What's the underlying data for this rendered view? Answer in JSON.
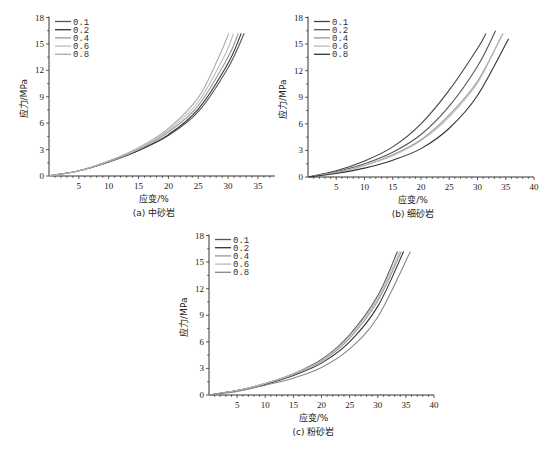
{
  "chart_data": [
    {
      "id": "a",
      "type": "line",
      "caption": "(a) 中砂岩",
      "xlabel": "应变/%",
      "ylabel": "应力/MPa",
      "xlim": [
        0,
        37
      ],
      "ylim": [
        0,
        18
      ],
      "xticks": [
        5,
        10,
        15,
        20,
        25,
        30,
        35
      ],
      "yticks": [
        0,
        3,
        6,
        9,
        12,
        15,
        18
      ],
      "legend_position": "upper-left",
      "grid": false,
      "series": [
        {
          "name": "0.1",
          "color": "#555555",
          "x": [
            0,
            5,
            10,
            15,
            20,
            25,
            30,
            32.7
          ],
          "y": [
            0,
            0.6,
            1.6,
            2.9,
            4.6,
            7.3,
            12.3,
            16.2
          ]
        },
        {
          "name": "0.2",
          "color": "#333333",
          "x": [
            0,
            5,
            10,
            15,
            20,
            25,
            30,
            32.2
          ],
          "y": [
            0,
            0.6,
            1.6,
            2.9,
            4.7,
            7.6,
            12.8,
            16.2
          ]
        },
        {
          "name": "0.4",
          "color": "#999999",
          "x": [
            0,
            5,
            10,
            15,
            20,
            25,
            30,
            31.7
          ],
          "y": [
            0,
            0.6,
            1.6,
            3.0,
            5.0,
            8.0,
            13.5,
            16.2
          ]
        },
        {
          "name": "0.6",
          "color": "#bbbbbb",
          "x": [
            0,
            5,
            10,
            15,
            20,
            25,
            29.5,
            30.9
          ],
          "y": [
            0,
            0.6,
            1.7,
            3.1,
            5.2,
            8.4,
            13.8,
            16.2
          ]
        },
        {
          "name": "0.8",
          "color": "#aaaaaa",
          "x": [
            0,
            5,
            10,
            15,
            20,
            25,
            28.5,
            30.1
          ],
          "y": [
            0,
            0.6,
            1.7,
            3.2,
            5.4,
            8.9,
            13.6,
            16.2
          ]
        }
      ]
    },
    {
      "id": "b",
      "type": "line",
      "caption": "(b) 细砂岩",
      "xlabel": "应变/%",
      "ylabel": "应力/MPa",
      "xlim": [
        0,
        40
      ],
      "ylim": [
        0,
        18
      ],
      "xticks": [
        5,
        10,
        15,
        20,
        25,
        30,
        35,
        40
      ],
      "yticks": [
        0,
        3,
        6,
        9,
        12,
        15,
        18
      ],
      "legend_position": "upper-left",
      "grid": false,
      "series": [
        {
          "name": "0.1",
          "color": "#444444",
          "x": [
            0,
            5,
            10,
            15,
            20,
            25,
            30,
            31.5
          ],
          "y": [
            0,
            0.7,
            1.8,
            3.4,
            6.0,
            9.8,
            14.5,
            16.2
          ]
        },
        {
          "name": "0.2",
          "color": "#555555",
          "x": [
            0,
            5,
            10,
            15,
            20,
            25,
            30,
            33.2
          ],
          "y": [
            0,
            0.6,
            1.5,
            2.8,
            4.8,
            8.0,
            12.5,
            16.5
          ]
        },
        {
          "name": "0.4",
          "color": "#999999",
          "x": [
            0,
            5,
            10,
            15,
            20,
            25,
            30,
            34.5
          ],
          "y": [
            0,
            0.5,
            1.3,
            2.5,
            4.2,
            7.0,
            10.8,
            16.2
          ]
        },
        {
          "name": "0.6",
          "color": "#bbbbbb",
          "x": [
            0,
            5,
            10,
            15,
            20,
            25,
            30,
            34.3
          ],
          "y": [
            0,
            0.5,
            1.3,
            2.4,
            4.1,
            6.8,
            10.6,
            16.0
          ]
        },
        {
          "name": "0.8",
          "color": "#333333",
          "x": [
            0,
            5,
            10,
            15,
            20,
            25,
            30,
            35.5
          ],
          "y": [
            0,
            0.4,
            1.0,
            1.9,
            3.2,
            5.5,
            9.2,
            15.6
          ]
        }
      ]
    },
    {
      "id": "c",
      "type": "line",
      "caption": "(c) 粉砂岩",
      "xlabel": "应变/%",
      "ylabel": "应力/MPa",
      "xlim": [
        0,
        40
      ],
      "ylim": [
        0,
        18
      ],
      "xticks": [
        5,
        10,
        15,
        20,
        25,
        30,
        35,
        40
      ],
      "yticks": [
        0,
        3,
        6,
        9,
        12,
        15,
        18
      ],
      "legend_position": "upper-left",
      "grid": false,
      "series": [
        {
          "name": "0.1",
          "color": "#555555",
          "x": [
            0,
            5,
            10,
            15,
            20,
            25,
            30,
            33.5
          ],
          "y": [
            0,
            0.5,
            1.3,
            2.4,
            4.0,
            6.8,
            11.2,
            16.2
          ]
        },
        {
          "name": "0.2",
          "color": "#333333",
          "x": [
            0,
            5,
            10,
            15,
            20,
            25,
            30,
            34.6
          ],
          "y": [
            0,
            0.5,
            1.2,
            2.2,
            3.6,
            6.0,
            10.0,
            16.2
          ]
        },
        {
          "name": "0.4",
          "color": "#999999",
          "x": [
            0,
            5,
            10,
            15,
            20,
            25,
            30,
            34.2
          ],
          "y": [
            0,
            0.5,
            1.3,
            2.3,
            3.8,
            6.4,
            10.6,
            16.2
          ]
        },
        {
          "name": "0.6",
          "color": "#bbbbbb",
          "x": [
            0,
            5,
            10,
            15,
            20,
            25,
            30,
            33.9
          ],
          "y": [
            0,
            0.5,
            1.3,
            2.4,
            3.9,
            6.6,
            10.9,
            16.2
          ]
        },
        {
          "name": "0.8",
          "color": "#888888",
          "x": [
            0,
            5,
            10,
            15,
            20,
            25,
            30,
            35.8
          ],
          "y": [
            0,
            0.4,
            1.1,
            1.9,
            3.1,
            5.2,
            8.8,
            16.2
          ]
        }
      ]
    }
  ]
}
